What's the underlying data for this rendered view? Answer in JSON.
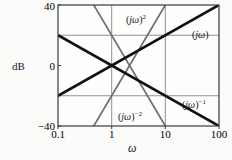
{
  "figure": {
    "background_color": "#fbfbfa",
    "frame_color": "#3a3a3a",
    "grid_color": "#8a8a8a"
  },
  "axes": {
    "ylabel": "dB",
    "xlabel": "ω",
    "yticks": [
      "40",
      "0",
      "−40"
    ],
    "ytick_values": [
      40,
      0,
      -40
    ],
    "xticks": [
      "0.1",
      "1",
      "10",
      "100"
    ],
    "xtick_values": [
      0.1,
      1,
      10,
      100
    ],
    "ygridlines": [
      20,
      -20
    ],
    "xgridlines": [
      1,
      10
    ]
  },
  "curves": {
    "jw2": {
      "label_html": "(<span class=\"it\">jω</span>)<sup>2</sup>",
      "color": "#6e6e6e",
      "width": 1.6
    },
    "jw1": {
      "label_html": "(<span class=\"it\">jω</span>)",
      "color": "#111111",
      "width": 2.6
    },
    "jwm1": {
      "label_html": "(<span class=\"it\">jω</span>)<sup>−1</sup>",
      "color": "#111111",
      "width": 2.6
    },
    "jwm2": {
      "label_html": "(<span class=\"it\">jω</span>)<sup>−2</sup>",
      "color": "#6e6e6e",
      "width": 1.6
    }
  },
  "chart_data": {
    "type": "line",
    "title": "",
    "xlabel": "ω",
    "ylabel": "dB",
    "xscale": "log",
    "xlim": [
      0.1,
      100
    ],
    "ylim": [
      -40,
      40
    ],
    "grid": true,
    "legend": "inline-annotations",
    "xticks": [
      0.1,
      1,
      10,
      100
    ],
    "yticks": [
      -40,
      0,
      40
    ],
    "series": [
      {
        "name": "(jω)^2",
        "slope_db_per_decade": 40,
        "color": "#6e6e6e",
        "x": [
          0.1,
          1,
          10,
          100
        ],
        "y": [
          -80,
          0,
          40,
          80
        ],
        "visible_x": [
          0.1,
          1,
          10
        ],
        "visible_y": [
          -80,
          0,
          40
        ],
        "annotation": "(jω)²"
      },
      {
        "name": "(jω)",
        "slope_db_per_decade": 20,
        "color": "#111111",
        "x": [
          0.1,
          1,
          10,
          100
        ],
        "y": [
          -20,
          0,
          20,
          40
        ],
        "annotation": "(jω)"
      },
      {
        "name": "(jω)^-1",
        "slope_db_per_decade": -20,
        "color": "#111111",
        "x": [
          0.1,
          1,
          10,
          100
        ],
        "y": [
          20,
          0,
          -20,
          -40
        ],
        "annotation": "(jω)⁻¹"
      },
      {
        "name": "(jω)^-2",
        "slope_db_per_decade": -40,
        "color": "#6e6e6e",
        "x": [
          0.1,
          1,
          10,
          100
        ],
        "y": [
          80,
          0,
          -40,
          -80
        ],
        "visible_x": [
          0.1,
          1,
          10
        ],
        "visible_y": [
          80,
          0,
          -40
        ],
        "annotation": "(jω)⁻²"
      }
    ],
    "annotations": [
      {
        "text": "(jω)²",
        "x": 3.3,
        "y": 32
      },
      {
        "text": "(jω)",
        "x": 55,
        "y": 27
      },
      {
        "text": "(jω)⁻¹",
        "x": 42,
        "y": -22
      },
      {
        "text": "(jω)⁻²",
        "x": 3.0,
        "y": -30
      }
    ],
    "crossing_point": {
      "x": 1,
      "y": 0
    }
  }
}
